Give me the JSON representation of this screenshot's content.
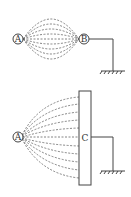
{
  "diagram": {
    "top": {
      "charge_a_label": "A",
      "charge_b_label": "B",
      "field_lines": 9,
      "grounded": "B"
    },
    "bottom": {
      "charge_a_label": "A",
      "plate_label": "C",
      "field_lines": 12,
      "grounded": "C"
    },
    "colors": {
      "line": "#444444",
      "field": "#666666"
    }
  }
}
